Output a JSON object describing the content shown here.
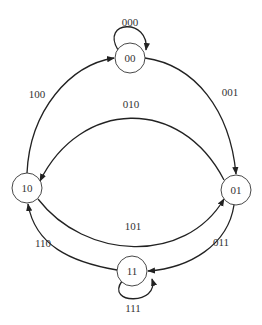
{
  "diagram": {
    "type": "state-transition",
    "colors": {
      "stroke": "#222222",
      "text": "#333333",
      "background": "#ffffff"
    },
    "nodes": [
      {
        "id": "00",
        "label": "00",
        "cx": 130,
        "cy": 58
      },
      {
        "id": "01",
        "label": "01",
        "cx": 236,
        "cy": 190
      },
      {
        "id": "10",
        "label": "10",
        "cx": 27,
        "cy": 188
      },
      {
        "id": "11",
        "label": "11",
        "cx": 132,
        "cy": 271
      }
    ],
    "edges": [
      {
        "from": "00",
        "to": "00",
        "label": "000"
      },
      {
        "from": "00",
        "to": "01",
        "label": "001"
      },
      {
        "from": "01",
        "to": "10",
        "label": "010"
      },
      {
        "from": "01",
        "to": "11",
        "label": "011"
      },
      {
        "from": "10",
        "to": "00",
        "label": "100"
      },
      {
        "from": "10",
        "to": "01",
        "label": "101"
      },
      {
        "from": "11",
        "to": "10",
        "label": "110"
      },
      {
        "from": "11",
        "to": "11",
        "label": "111"
      }
    ]
  }
}
